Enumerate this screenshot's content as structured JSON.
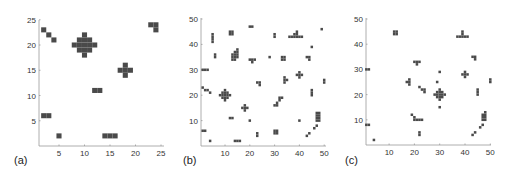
{
  "figure": {
    "cell_color": "#4a4a4a",
    "axis_color": "#999999"
  },
  "chart_data": [
    {
      "type": "heatmap",
      "panel_label": "(a)",
      "xlim": [
        0,
        25
      ],
      "ylim": [
        0,
        25
      ],
      "xticks": [
        5,
        10,
        15,
        20,
        25
      ],
      "yticks": [
        5,
        10,
        15,
        20,
        25
      ],
      "grid": false,
      "frame": {
        "x0": 33.5,
        "y0": 146,
        "px_per_unit_x": 5.1,
        "px_per_unit_y": 5.05,
        "axis_left": 39,
        "axis_top": 20,
        "axis_right": 164,
        "label_x": 14,
        "label_y": 164
      },
      "cells": [
        [
          2,
          23
        ],
        [
          3,
          22
        ],
        [
          4,
          21
        ],
        [
          10,
          22
        ],
        [
          9,
          21
        ],
        [
          10,
          21
        ],
        [
          11,
          21
        ],
        [
          8,
          20
        ],
        [
          9,
          20
        ],
        [
          10,
          20
        ],
        [
          11,
          20
        ],
        [
          12,
          20
        ],
        [
          9,
          19
        ],
        [
          10,
          19
        ],
        [
          11,
          19
        ],
        [
          10,
          18
        ],
        [
          18,
          16
        ],
        [
          17,
          15
        ],
        [
          18,
          15
        ],
        [
          19,
          15
        ],
        [
          18,
          14
        ],
        [
          12,
          11
        ],
        [
          13,
          11
        ],
        [
          23,
          24
        ],
        [
          24,
          24
        ],
        [
          24,
          23
        ],
        [
          2,
          6
        ],
        [
          3,
          6
        ],
        [
          5,
          2
        ],
        [
          14,
          2
        ],
        [
          15,
          2
        ],
        [
          16,
          2
        ]
      ]
    },
    {
      "type": "heatmap",
      "panel_label": "(b)",
      "xlim": [
        0,
        50
      ],
      "ylim": [
        0,
        50
      ],
      "xticks": [
        10,
        20,
        30,
        40,
        50
      ],
      "yticks": [
        10,
        20,
        30,
        40,
        50
      ],
      "grid": false,
      "frame": {
        "x0": 200.2,
        "y0": 146,
        "px_per_unit_x": 2.48,
        "px_per_unit_y": 2.54,
        "axis_left": 201,
        "axis_top": 18,
        "axis_right": 326,
        "label_x": 183,
        "label_y": 164
      },
      "cells": [
        [
          20,
          47
        ],
        [
          21,
          47
        ],
        [
          12,
          45
        ],
        [
          13,
          45
        ],
        [
          12,
          44
        ],
        [
          13,
          44
        ],
        [
          5,
          44
        ],
        [
          5,
          43
        ],
        [
          5,
          42
        ],
        [
          5,
          41
        ],
        [
          30,
          44
        ],
        [
          30,
          43
        ],
        [
          39,
          45
        ],
        [
          38,
          44
        ],
        [
          39,
          44
        ],
        [
          36,
          43
        ],
        [
          37,
          43
        ],
        [
          38,
          43
        ],
        [
          39,
          43
        ],
        [
          40,
          43
        ],
        [
          41,
          43
        ],
        [
          49,
          46
        ],
        [
          45,
          39
        ],
        [
          6,
          36
        ],
        [
          6,
          35
        ],
        [
          15,
          38
        ],
        [
          15,
          37
        ],
        [
          14,
          37
        ],
        [
          15,
          36
        ],
        [
          14,
          36
        ],
        [
          13,
          36
        ],
        [
          14,
          35
        ],
        [
          13,
          35
        ],
        [
          15,
          35
        ],
        [
          14,
          34
        ],
        [
          13,
          34
        ],
        [
          20,
          34
        ],
        [
          21,
          34
        ],
        [
          22,
          34
        ],
        [
          21,
          33
        ],
        [
          28,
          35
        ],
        [
          33,
          35
        ],
        [
          34,
          35
        ],
        [
          33,
          34
        ],
        [
          34,
          34
        ],
        [
          43,
          35
        ],
        [
          44,
          35
        ],
        [
          44,
          34
        ],
        [
          1,
          30
        ],
        [
          2,
          30
        ],
        [
          3,
          30
        ],
        [
          40,
          29
        ],
        [
          39,
          28
        ],
        [
          40,
          28
        ],
        [
          41,
          28
        ],
        [
          40,
          27
        ],
        [
          34,
          27
        ],
        [
          34,
          26
        ],
        [
          35,
          26
        ],
        [
          34,
          25
        ],
        [
          23,
          25
        ],
        [
          24,
          25
        ],
        [
          24,
          24
        ],
        [
          50,
          26
        ],
        [
          50,
          25
        ],
        [
          1,
          23
        ],
        [
          2,
          22
        ],
        [
          3,
          22
        ],
        [
          4,
          21
        ],
        [
          10,
          22
        ],
        [
          9,
          21
        ],
        [
          10,
          21
        ],
        [
          11,
          21
        ],
        [
          8,
          20
        ],
        [
          9,
          20
        ],
        [
          10,
          20
        ],
        [
          11,
          20
        ],
        [
          12,
          20
        ],
        [
          9,
          19
        ],
        [
          10,
          19
        ],
        [
          11,
          19
        ],
        [
          10,
          18
        ],
        [
          45,
          22
        ],
        [
          45,
          21
        ],
        [
          45,
          20
        ],
        [
          32,
          19
        ],
        [
          33,
          19
        ],
        [
          32,
          18
        ],
        [
          31,
          17
        ],
        [
          31,
          16
        ],
        [
          30,
          16
        ],
        [
          18,
          16
        ],
        [
          17,
          15
        ],
        [
          18,
          15
        ],
        [
          19,
          15
        ],
        [
          18,
          14
        ],
        [
          12,
          11
        ],
        [
          13,
          11
        ],
        [
          20,
          10
        ],
        [
          40,
          10
        ],
        [
          47,
          13
        ],
        [
          48,
          13
        ],
        [
          47,
          12
        ],
        [
          48,
          12
        ],
        [
          47,
          11
        ],
        [
          48,
          11
        ],
        [
          47,
          10
        ],
        [
          48,
          10
        ],
        [
          47,
          8
        ],
        [
          46,
          7
        ],
        [
          1,
          6
        ],
        [
          2,
          6
        ],
        [
          30,
          6
        ],
        [
          31,
          6
        ],
        [
          30,
          5
        ],
        [
          31,
          5
        ],
        [
          23,
          5
        ],
        [
          23,
          4
        ],
        [
          44,
          5
        ],
        [
          43,
          4
        ],
        [
          4,
          2
        ],
        [
          14,
          2
        ],
        [
          15,
          2
        ],
        [
          16,
          2
        ]
      ]
    },
    {
      "type": "heatmap",
      "panel_label": "(c)",
      "xlim": [
        0,
        50
      ],
      "ylim": [
        0,
        50
      ],
      "xticks": [
        10,
        20,
        30,
        40,
        50
      ],
      "yticks": [
        10,
        20,
        30,
        40,
        50
      ],
      "grid": false,
      "frame": {
        "x0": 363.8,
        "y0": 145,
        "px_per_unit_x": 2.53,
        "px_per_unit_y": 2.52,
        "axis_left": 366,
        "axis_top": 18,
        "axis_right": 491,
        "label_x": 345,
        "label_y": 164
      },
      "cells": [
        [
          12,
          45
        ],
        [
          13,
          45
        ],
        [
          12,
          44
        ],
        [
          13,
          44
        ],
        [
          39,
          45
        ],
        [
          39,
          44
        ],
        [
          37,
          43
        ],
        [
          38,
          43
        ],
        [
          39,
          43
        ],
        [
          40,
          43
        ],
        [
          41,
          43
        ],
        [
          43,
          35
        ],
        [
          44,
          35
        ],
        [
          44,
          34
        ],
        [
          20,
          33
        ],
        [
          21,
          33
        ],
        [
          22,
          33
        ],
        [
          21,
          32
        ],
        [
          1,
          30
        ],
        [
          2,
          30
        ],
        [
          30,
          29
        ],
        [
          40,
          29
        ],
        [
          39,
          28
        ],
        [
          40,
          28
        ],
        [
          41,
          28
        ],
        [
          40,
          27
        ],
        [
          18,
          26
        ],
        [
          17,
          25
        ],
        [
          18,
          25
        ],
        [
          18,
          24
        ],
        [
          29,
          25
        ],
        [
          50,
          26
        ],
        [
          50,
          25
        ],
        [
          22,
          23
        ],
        [
          23,
          22
        ],
        [
          24,
          22
        ],
        [
          24,
          21
        ],
        [
          45,
          22
        ],
        [
          45,
          21
        ],
        [
          45,
          20
        ],
        [
          30,
          22
        ],
        [
          29,
          21
        ],
        [
          30,
          21
        ],
        [
          31,
          21
        ],
        [
          28,
          20
        ],
        [
          29,
          20
        ],
        [
          30,
          20
        ],
        [
          31,
          20
        ],
        [
          32,
          20
        ],
        [
          29,
          19
        ],
        [
          30,
          19
        ],
        [
          31,
          19
        ],
        [
          30,
          18
        ],
        [
          30,
          15
        ],
        [
          48,
          13
        ],
        [
          47,
          12
        ],
        [
          48,
          12
        ],
        [
          47,
          11
        ],
        [
          48,
          11
        ],
        [
          47,
          10
        ],
        [
          48,
          10
        ],
        [
          19,
          12
        ],
        [
          20,
          11
        ],
        [
          20,
          10
        ],
        [
          21,
          10
        ],
        [
          22,
          10
        ],
        [
          23,
          10
        ],
        [
          1,
          8
        ],
        [
          2,
          8
        ],
        [
          47,
          8
        ],
        [
          46,
          7
        ],
        [
          22,
          5
        ],
        [
          22,
          4
        ],
        [
          44,
          5
        ],
        [
          43,
          4
        ],
        [
          4,
          2
        ]
      ]
    }
  ]
}
